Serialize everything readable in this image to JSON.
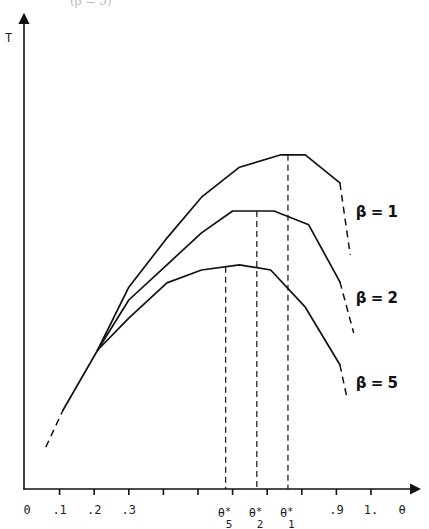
{
  "header": {
    "cropped_caption": "(β = 5)"
  },
  "chart_data": {
    "type": "line",
    "title": "",
    "xlabel": "θ",
    "ylabel": "T",
    "xlim": [
      0,
      1.1
    ],
    "ylim": [
      0,
      1
    ],
    "grid": false,
    "legend_position": "inline-right",
    "x_ticks": [
      0.1,
      0.2,
      0.3,
      0.4,
      0.5,
      0.6,
      0.7,
      0.8,
      0.9,
      1.0
    ],
    "x_tick_labels": [
      {
        "text": "0",
        "at": 0.0
      },
      {
        "text": ".1",
        "at": 0.1
      },
      {
        "text": ".2",
        "at": 0.2
      },
      {
        "text": ".3",
        "at": 0.3
      },
      {
        "text": ".9",
        "at": 0.9
      },
      {
        "text": "1.",
        "at": 1.0
      },
      {
        "text": "θ",
        "at": 1.09
      }
    ],
    "common_start": {
      "dashed": [
        [
          0.06,
          0.088
        ],
        [
          0.11,
          0.166
        ]
      ],
      "solid": [
        [
          0.11,
          0.166
        ],
        [
          0.21,
          0.292
        ]
      ]
    },
    "series": [
      {
        "name": "β = 1",
        "label": "β = 1",
        "x": [
          0.21,
          0.3,
          0.41,
          0.51,
          0.62,
          0.74,
          0.81,
          0.91
        ],
        "values": [
          0.292,
          0.424,
          0.527,
          0.613,
          0.676,
          0.702,
          0.702,
          0.643
        ],
        "dashed_tail": [
          [
            0.91,
            0.643
          ],
          [
            0.94,
            0.492
          ]
        ],
        "optimum": {
          "label": "θ*",
          "sub": "1",
          "theta": 0.76,
          "T": 0.702
        },
        "label_pos": [
          0.95,
          0.58
        ]
      },
      {
        "name": "β = 2",
        "label": "β = 2",
        "x": [
          0.21,
          0.3,
          0.41,
          0.51,
          0.6,
          0.72,
          0.82,
          0.91
        ],
        "values": [
          0.292,
          0.397,
          0.471,
          0.538,
          0.584,
          0.584,
          0.555,
          0.435
        ],
        "dashed_tail": [
          [
            0.91,
            0.435
          ],
          [
            0.95,
            0.328
          ]
        ],
        "optimum": {
          "label": "θ*",
          "sub": "2",
          "theta": 0.67,
          "T": 0.584
        },
        "label_pos": [
          0.95,
          0.4
        ]
      },
      {
        "name": "β = 5",
        "label": "β = 5",
        "x": [
          0.21,
          0.3,
          0.41,
          0.51,
          0.62,
          0.71,
          0.81,
          0.91
        ],
        "values": [
          0.292,
          0.359,
          0.433,
          0.46,
          0.471,
          0.46,
          0.382,
          0.261
        ],
        "dashed_tail": [
          [
            0.91,
            0.261
          ],
          [
            0.93,
            0.193
          ]
        ],
        "optimum": {
          "label": "θ*",
          "sub": "5",
          "theta": 0.58,
          "T": 0.467
        },
        "label_pos": [
          0.95,
          0.22
        ]
      }
    ],
    "annotations": [
      "θ*5",
      "θ*2",
      "θ*1",
      "β = 1",
      "β = 2",
      "β = 5"
    ]
  },
  "layout": {
    "origin_px": [
      25,
      489
    ],
    "x_scale_px": 346,
    "y_scale_px": 476,
    "yaxis_px": 24,
    "x_arrow_end_px": 421,
    "y_arrow_top_px": 13
  },
  "colors": {
    "ink": "#111111",
    "background": "#ffffff"
  }
}
